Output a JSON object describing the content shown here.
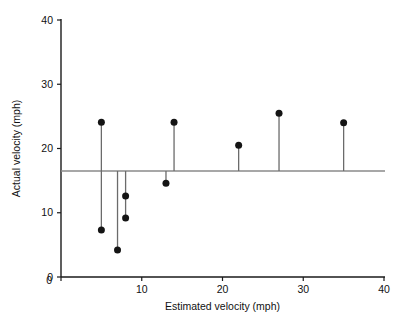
{
  "chart_data": {
    "type": "scatter",
    "title": "",
    "xlabel": "Estimated velocity (mph)",
    "ylabel": "Actual velocity (mph)",
    "xlim": [
      0,
      40
    ],
    "ylim": [
      0,
      40
    ],
    "xticks": [
      0,
      10,
      20,
      30,
      40
    ],
    "yticks": [
      0,
      10,
      20,
      30,
      40
    ],
    "xtick_labels": [
      "0",
      "10",
      "20",
      "30",
      "40"
    ],
    "ytick_labels": [
      "0",
      "10",
      "20",
      "30",
      "40"
    ],
    "grid": false,
    "legend": null,
    "reference_line": {
      "orientation": "horizontal",
      "y": 16.5,
      "label": ""
    },
    "marker": {
      "shape": "circle",
      "color": "#141414",
      "size_px": 7
    },
    "stem_color": "#6b6b6b",
    "points": [
      {
        "x": 5,
        "y": 24.1
      },
      {
        "x": 5,
        "y": 7.3
      },
      {
        "x": 7,
        "y": 4.2
      },
      {
        "x": 8,
        "y": 12.6
      },
      {
        "x": 8,
        "y": 9.2
      },
      {
        "x": 13,
        "y": 14.6
      },
      {
        "x": 14,
        "y": 24.1
      },
      {
        "x": 22,
        "y": 20.5
      },
      {
        "x": 27,
        "y": 25.5
      },
      {
        "x": 35,
        "y": 24.0
      }
    ],
    "stems": [
      {
        "x": 5,
        "y_from": 24.1,
        "y_to": 7.3
      },
      {
        "x": 7,
        "y_from": 16.5,
        "y_to": 4.2
      },
      {
        "x": 8,
        "y_from": 16.5,
        "y_to": 9.2
      },
      {
        "x": 13,
        "y_from": 16.5,
        "y_to": 14.6
      },
      {
        "x": 14,
        "y_from": 16.5,
        "y_to": 24.1
      },
      {
        "x": 22,
        "y_from": 16.5,
        "y_to": 20.5
      },
      {
        "x": 27,
        "y_from": 16.5,
        "y_to": 25.5
      },
      {
        "x": 35,
        "y_from": 16.5,
        "y_to": 24.0
      }
    ]
  }
}
